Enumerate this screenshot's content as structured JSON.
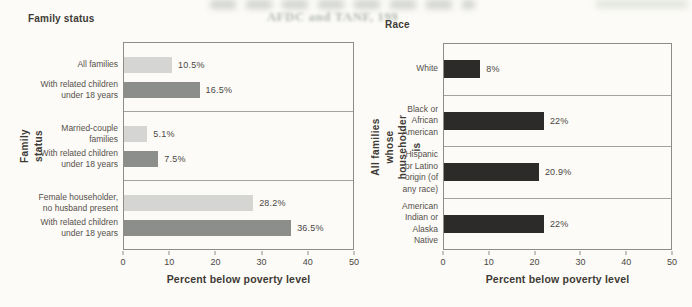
{
  "page": {
    "background_color": "#fcfbf8",
    "bleed_text": "AFDC and TANF, 199"
  },
  "chart_data": [
    {
      "type": "bar",
      "orientation": "horizontal",
      "title": "Family status",
      "xlabel": "Percent below poverty level",
      "ylabel": "Family status",
      "xlim": [
        0,
        50
      ],
      "x_ticks": [
        0,
        10,
        20,
        30,
        40,
        50
      ],
      "grid": false,
      "legend": false,
      "colors": {
        "light": "#d5d6d4",
        "dark": "#8c8e8c"
      },
      "groups": [
        {
          "bars": [
            {
              "category": "All families",
              "value": 10.5,
              "label": "10.5%",
              "shade": "light"
            },
            {
              "category": "With related children\nunder 18 years",
              "value": 16.5,
              "label": "16.5%",
              "shade": "dark"
            }
          ]
        },
        {
          "bars": [
            {
              "category": "Married-couple\nfamilies",
              "value": 5.1,
              "label": "5.1%",
              "shade": "light"
            },
            {
              "category": "With related children\nunder 18 years",
              "value": 7.5,
              "label": "7.5%",
              "shade": "dark"
            }
          ]
        },
        {
          "bars": [
            {
              "category": "Female householder,\nno husband present",
              "value": 28.2,
              "label": "28.2%",
              "shade": "light"
            },
            {
              "category": "With related children\nunder 18 years",
              "value": 36.5,
              "label": "36.5%",
              "shade": "dark"
            }
          ]
        }
      ]
    },
    {
      "type": "bar",
      "orientation": "horizontal",
      "title": "Race",
      "xlabel": "Percent below poverty level",
      "ylabel": "All families whose\nhouseholder is",
      "xlim": [
        0,
        50
      ],
      "x_ticks": [
        0,
        10,
        20,
        30,
        40,
        50
      ],
      "grid": false,
      "legend": false,
      "colors": {
        "black": "#2d2b29"
      },
      "groups": [
        {
          "bars": [
            {
              "category": "White",
              "value": 8,
              "label": "8%",
              "shade": "black"
            }
          ]
        },
        {
          "bars": [
            {
              "category": "Black or\nAfrican\nAmerican",
              "value": 22,
              "label": "22%",
              "shade": "black"
            }
          ]
        },
        {
          "bars": [
            {
              "category": "Hispanic\nor Latino\norigin (of\nany race)",
              "value": 20.9,
              "label": "20.9%",
              "shade": "black"
            }
          ]
        },
        {
          "bars": [
            {
              "category": "American\nIndian or\nAlaska\nNative",
              "value": 22,
              "label": "22%",
              "shade": "black"
            }
          ]
        }
      ]
    }
  ]
}
